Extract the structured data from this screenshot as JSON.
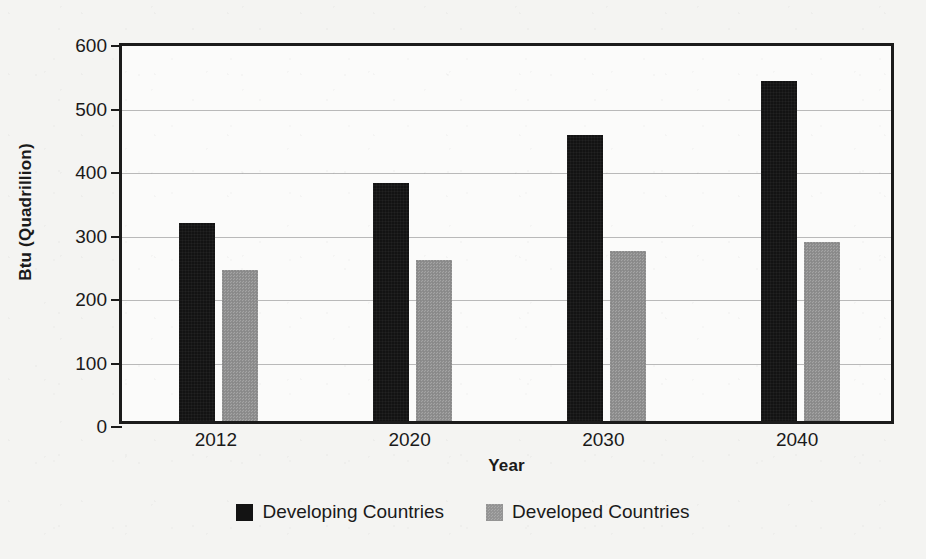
{
  "chart_data": {
    "type": "bar",
    "title": "",
    "xlabel": "Year",
    "ylabel": "Btu (Quadrillion)",
    "categories": [
      "2012",
      "2020",
      "2030",
      "2040"
    ],
    "series": [
      {
        "name": "Developing Countries",
        "color": "#131313",
        "values": [
          312,
          375,
          450,
          535
        ]
      },
      {
        "name": "Developed Countries",
        "color": "#8f8f8f",
        "values": [
          238,
          254,
          267,
          282
        ]
      }
    ],
    "ylim": [
      0,
      600
    ],
    "yticks": [
      0,
      100,
      200,
      300,
      400,
      500,
      600
    ],
    "ytick_labels": [
      "0",
      "100",
      "200",
      "300",
      "400",
      "500",
      "600"
    ],
    "grid": true,
    "grid_axis": "y",
    "legend_position": "bottom",
    "bar_group_mode": "grouped"
  },
  "legend": {
    "items": [
      {
        "label": "Developing Countries",
        "swatch": "black-square-swatch"
      },
      {
        "label": "Developed Countries",
        "swatch": "gray-square-swatch"
      }
    ]
  },
  "colors": {
    "series_developing": "#131313",
    "series_developed": "#8f8f8f",
    "axis": "#1b1b1b",
    "gridline": "#b9b9b9",
    "background": "#f4f4f2",
    "plot_background": "#fbfbfa"
  }
}
